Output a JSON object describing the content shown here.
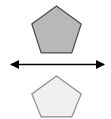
{
  "canvas": {
    "width": 111,
    "height": 119,
    "background": "#ffffff",
    "title": "Two congruent pentagons separated by a double-headed arrow"
  },
  "colors": {
    "background": "#ffffff",
    "top_pentagon_fill": "#b8b8b8",
    "top_pentagon_stroke": "#4a4a4a",
    "bottom_pentagon_fill": "#f0f0f0",
    "bottom_pentagon_stroke": "#8c8c8c",
    "arrow_color": "#000000"
  },
  "shapes": {
    "top_pentagon": {
      "name": "top-pentagon",
      "sides": 5,
      "fill": "#b8b8b8",
      "stroke": "#4a4a4a",
      "stroke_width": 1.2,
      "center_x": 56.5,
      "center_y": 32,
      "radius": 26,
      "rotation_deg": 0,
      "bbox": {
        "x": 32,
        "y": 6,
        "width": 49,
        "height": 47
      },
      "points": "56.5,6 81.2,23.9 71.8,52.9 41.2,52.9 31.8,23.9"
    },
    "bottom_pentagon": {
      "name": "bottom-pentagon",
      "sides": 5,
      "fill": "#f0f0f0",
      "stroke": "#8c8c8c",
      "stroke_width": 1.2,
      "center_x": 56.5,
      "center_y": 97,
      "radius": 26,
      "rotation_deg": 0,
      "bbox": {
        "x": 32,
        "y": 76,
        "width": 49,
        "height": 41
      },
      "points": "56.5,76 81.2,93.9 71.8,116.9 41.2,116.9 31.8,93.9"
    },
    "arrow": {
      "name": "double-headed-arrow",
      "orientation": "horizontal",
      "double_headed": true,
      "color": "#000000",
      "shaft_y": 64.5,
      "x_start": 10,
      "x_end": 105,
      "shaft_width": 1.6,
      "head_length": 9,
      "head_half_height": 4.5,
      "left_head_points": "10,64.5 19,60 19,69",
      "right_head_points": "105,64.5 96,60 96,69"
    }
  },
  "labels": {
    "top_shape_label": "",
    "bottom_shape_label": "",
    "arrow_label": ""
  }
}
